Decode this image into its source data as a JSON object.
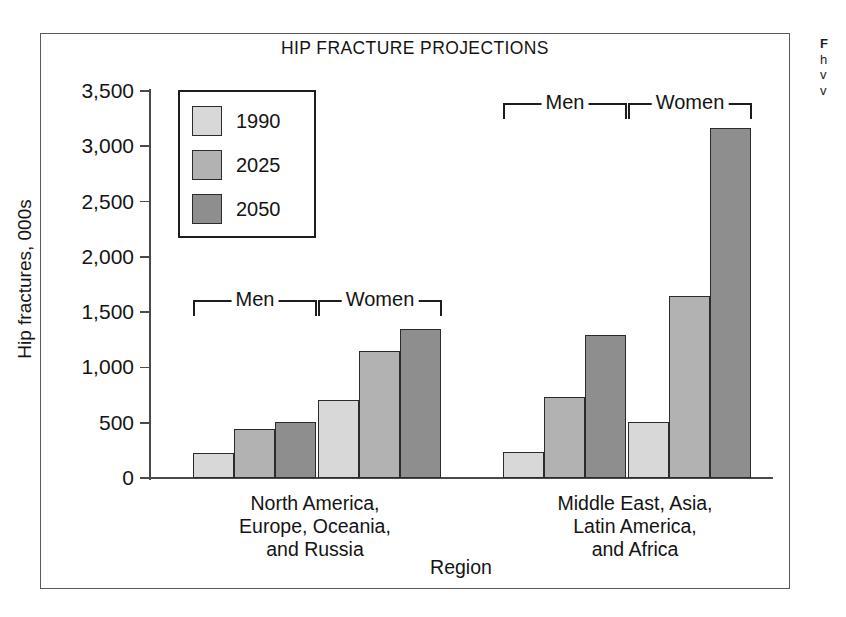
{
  "figure": {
    "title": "HIP FRACTURE PROJECTIONS",
    "xlabel": "Region",
    "ylabel": "Hip fractures, 000s"
  },
  "legend": {
    "items": [
      {
        "label": "1990",
        "color": "#d8d8d8"
      },
      {
        "label": "2025",
        "color": "#b2b2b2"
      },
      {
        "label": "2050",
        "color": "#8e8e8e"
      }
    ]
  },
  "brackets": [
    {
      "label": "Men"
    },
    {
      "label": "Women"
    },
    {
      "label": "Men"
    },
    {
      "label": "Women"
    }
  ],
  "axis": {
    "y_ticks": [
      "3,500",
      "3,000",
      "2,500",
      "2,000",
      "1,500",
      "1,000",
      "500",
      "0"
    ]
  },
  "categories": [
    {
      "lines": [
        "North America,",
        "Europe, Oceania,",
        "and Russia"
      ]
    },
    {
      "lines": [
        "Middle East, Asia,",
        "Latin America,",
        "and Africa"
      ]
    }
  ],
  "side_caption": {
    "lines": [
      "F",
      "h",
      "v",
      "v"
    ]
  },
  "chart_data": {
    "type": "bar",
    "title": "HIP FRACTURE PROJECTIONS",
    "xlabel": "Region",
    "ylabel": "Hip fractures, 000s",
    "ylim": [
      0,
      3500
    ],
    "ytick_values": [
      0,
      500,
      1000,
      1500,
      2000,
      2500,
      3000,
      3500
    ],
    "grid": false,
    "legend_position": "upper-left-inside",
    "categories": [
      "North America, Europe, Oceania, and Russia — Men",
      "North America, Europe, Oceania, and Russia — Women",
      "Middle East, Asia, Latin America, and Africa — Men",
      "Middle East, Asia, Latin America, and Africa — Women"
    ],
    "series": [
      {
        "name": "1990",
        "color": "#d8d8d8",
        "values": [
          230,
          705,
          235,
          510
        ]
      },
      {
        "name": "2025",
        "color": "#b2b2b2",
        "values": [
          445,
          1150,
          730,
          1650
        ]
      },
      {
        "name": "2050",
        "color": "#8e8e8e",
        "values": [
          510,
          1345,
          1290,
          3165
        ]
      }
    ],
    "units": "thousands of hip fractures"
  }
}
